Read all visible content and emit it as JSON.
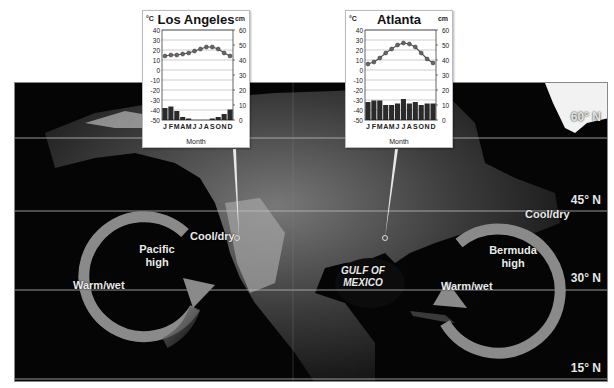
{
  "figure": {
    "latitudes": [
      "60° N",
      "45° N",
      "30° N",
      "15° N"
    ],
    "pressure_systems": [
      {
        "name": "Pacific\nhigh",
        "line1": "Pacific",
        "line2": "high",
        "rotation": "clockwise",
        "labels": {
          "cool": "Cool/dry",
          "warm": "Warm/wet"
        }
      },
      {
        "name": "Bermuda\nhigh",
        "line1": "Bermuda",
        "line2": "high",
        "rotation": "clockwise",
        "labels": {
          "cool": "Cool/dry",
          "warm": "Warm/wet"
        }
      }
    ],
    "water_body": {
      "line1": "GULF OF",
      "line2": "MEXICO"
    },
    "colors": {
      "arrow": "#8a8a8a",
      "ocean": "#050505",
      "land": "#5a5a5a",
      "graticule": "#bdbdbd",
      "temp_line": "#555555",
      "precip_bar": "#2a2a2a"
    }
  },
  "chart_data": [
    {
      "type": "bar+line",
      "title": "Los Angeles",
      "xlabel": "Month",
      "left_unit": "°C",
      "right_unit": "cm",
      "categories": [
        "J",
        "F",
        "M",
        "A",
        "M",
        "J",
        "J",
        "A",
        "S",
        "O",
        "N",
        "D"
      ],
      "left_ticks": [
        40,
        30,
        20,
        10,
        0,
        -10,
        -20,
        -30,
        -40,
        -50
      ],
      "right_ticks": [
        60,
        50,
        40,
        30,
        20,
        10,
        0
      ],
      "ylim_temp": [
        -50,
        40
      ],
      "ylim_precip": [
        0,
        60
      ],
      "series": [
        {
          "name": "Temperature (°C)",
          "type": "line",
          "values": [
            14,
            15,
            15,
            16,
            17,
            19,
            21,
            23,
            23,
            21,
            17,
            14
          ]
        },
        {
          "name": "Precipitation (cm)",
          "type": "bar",
          "values": [
            8,
            9,
            6,
            2,
            1,
            0,
            0,
            0,
            1,
            2,
            4,
            7
          ]
        }
      ]
    },
    {
      "type": "bar+line",
      "title": "Atlanta",
      "xlabel": "Month",
      "left_unit": "°C",
      "right_unit": "cm",
      "categories": [
        "J",
        "F",
        "M",
        "A",
        "M",
        "J",
        "J",
        "A",
        "S",
        "O",
        "N",
        "D"
      ],
      "left_ticks": [
        40,
        30,
        20,
        10,
        0,
        -10,
        -20,
        -30,
        -40,
        -50
      ],
      "right_ticks": [
        60,
        50,
        40,
        30,
        20,
        10,
        0
      ],
      "ylim_temp": [
        -50,
        40
      ],
      "ylim_precip": [
        0,
        60
      ],
      "series": [
        {
          "name": "Temperature (°C)",
          "type": "line",
          "values": [
            6,
            8,
            12,
            17,
            21,
            25,
            27,
            26,
            23,
            17,
            11,
            7
          ]
        },
        {
          "name": "Precipitation (cm)",
          "type": "bar",
          "values": [
            12,
            13,
            13,
            10,
            10,
            11,
            14,
            11,
            12,
            10,
            11,
            11
          ]
        }
      ]
    }
  ]
}
